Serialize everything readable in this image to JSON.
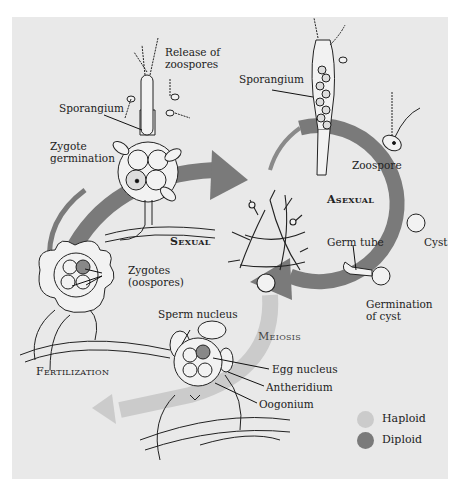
{
  "diagram": {
    "type": "life-cycle",
    "colors": {
      "background": "#e9e9e9",
      "haploid": "#cbcbcb",
      "diploid": "#7a7a7a",
      "line": "#222222"
    },
    "cycles": {
      "asexual_label": "Asexual",
      "sexual_label": "Sexual"
    },
    "labels": {
      "release_of_zoospores_1": "Release of",
      "release_of_zoospores_2": "zoospores",
      "sporangium_left": "Sporangium",
      "zygote_germination_1": "Zygote",
      "zygote_germination_2": "germination",
      "sporangium_right": "Sporangium",
      "zoospore": "Zoospore",
      "cyst": "Cyst",
      "germ_tube": "Germ tube",
      "germination_of_cyst_1": "Germination",
      "germination_of_cyst_2": "of cyst",
      "zygotes_1": "Zygotes",
      "zygotes_2": "(oospores)",
      "sperm_nucleus": "Sperm nucleus",
      "meiosis": "Meiosis",
      "egg_nucleus": "Egg nucleus",
      "antheridium": "Antheridium",
      "oogonium": "Oogonium",
      "fertilization": "Fertilization"
    },
    "legend": [
      {
        "label": "Haploid",
        "color": "#cbcbcb"
      },
      {
        "label": "Diploid",
        "color": "#7a7a7a"
      }
    ]
  }
}
